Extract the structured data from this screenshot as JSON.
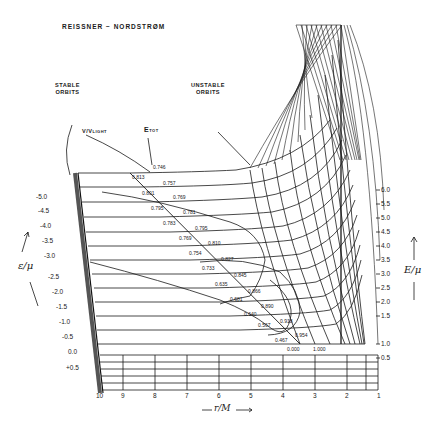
{
  "title": "REISSNER − NORDSTRØM",
  "callouts": {
    "stable": [
      "STABLE",
      "ORBITS"
    ],
    "unstable": [
      "UNSTABLE",
      "ORBITS"
    ],
    "velocity": "V/V",
    "velocity_sub": "LIGHT",
    "etot": "E",
    "etot_sub": "TOT"
  },
  "left_axis": {
    "label": "ε/μ",
    "ticks": [
      "-5.0",
      "-4.5",
      "-4.0",
      "-3.5",
      "-3.0",
      "-2.5",
      "-2.0",
      "-1.5",
      "-1.0",
      "-0.5",
      "0.0",
      "+0.5"
    ]
  },
  "right_axis": {
    "label": "E/μ",
    "ticks": [
      "6.0",
      "5.5",
      "5.0",
      "4.5",
      "4.0",
      "3.5",
      "3.0",
      "2.5",
      "2.0",
      "1.5",
      "1.0",
      "0.5"
    ]
  },
  "bottom_axis": {
    "label": "r/M",
    "ticks": [
      "10",
      "9",
      "8",
      "7",
      "6",
      "5",
      "4",
      "3",
      "2",
      "1"
    ]
  },
  "etot_values": [
    "0.746",
    "0.757",
    "0.769",
    "0.781",
    "0.795",
    "0.810",
    "0.827",
    "0.845",
    "0.866",
    "0.890",
    "0.918",
    "0.954",
    "1.000"
  ],
  "v_values": [
    "0.813",
    "0.801",
    "0.795",
    "0.783",
    "0.769",
    "0.754",
    "0.733",
    "0.635",
    "0.681",
    "0.640",
    "0.567",
    "0.467",
    "0.000"
  ]
}
